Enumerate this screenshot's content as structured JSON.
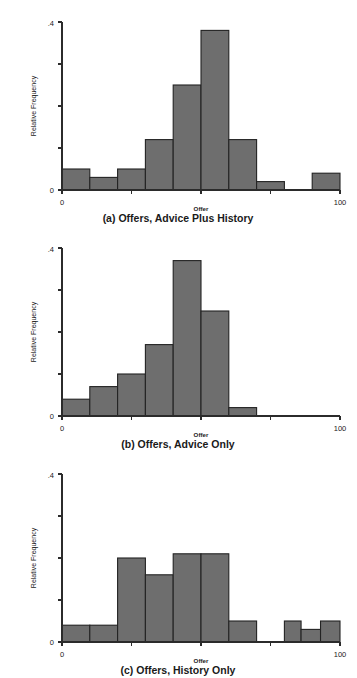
{
  "figure": {
    "title": "",
    "panel_count": 3,
    "bar_color": "#6e6e6e",
    "bar_edge_color": "#232323",
    "background": "#ffffff"
  },
  "panels": [
    {
      "id": "panel-a",
      "caption": "(a) Offers, Advice Plus History",
      "xlabel": "Offer",
      "ylabel": "Relative Frequency",
      "x_tick_labels": [
        "0",
        "",
        "",
        "",
        "100"
      ],
      "y_tick_labels": [
        "0",
        "",
        "",
        "",
        ".4"
      ]
    },
    {
      "id": "panel-b",
      "caption": "(b) Offers, Advice Only",
      "xlabel": "Offer",
      "ylabel": "Relative Frequency",
      "x_tick_labels": [
        "0",
        "",
        "",
        "",
        "100"
      ],
      "y_tick_labels": [
        "0",
        "",
        "",
        "",
        ".4"
      ]
    },
    {
      "id": "panel-c",
      "caption": "(c) Offers, History Only",
      "xlabel": "Offer",
      "ylabel": "Relative Frequency",
      "x_tick_labels": [
        "0",
        "",
        "",
        "",
        "100"
      ],
      "y_tick_labels": [
        "0",
        "",
        "",
        "",
        ".4"
      ]
    }
  ],
  "chart_data": [
    {
      "type": "bar",
      "title": "(a) Offers, Advice Plus History",
      "xlabel": "Offer",
      "ylabel": "Relative Frequency",
      "xlim": [
        0,
        100
      ],
      "ylim": [
        0,
        0.4
      ],
      "x_ticks": [
        0,
        25,
        50,
        75,
        100
      ],
      "x_tick_labels": [
        "0",
        "",
        "",
        "",
        "100"
      ],
      "y_ticks": [
        0,
        0.1,
        0.2,
        0.3,
        0.4
      ],
      "y_tick_labels": [
        "0",
        "",
        "",
        "",
        ".4"
      ],
      "grid": false,
      "legend": false,
      "bin_edges": [
        0,
        10,
        20,
        30,
        40,
        50,
        60,
        70,
        80,
        90,
        100
      ],
      "bins": [
        {
          "x0": 0,
          "x1": 10,
          "value": 0.05
        },
        {
          "x0": 10,
          "x1": 20,
          "value": 0.03
        },
        {
          "x0": 20,
          "x1": 30,
          "value": 0.05
        },
        {
          "x0": 30,
          "x1": 40,
          "value": 0.12
        },
        {
          "x0": 40,
          "x1": 50,
          "value": 0.25
        },
        {
          "x0": 50,
          "x1": 60,
          "value": 0.38
        },
        {
          "x0": 60,
          "x1": 70,
          "value": 0.12
        },
        {
          "x0": 70,
          "x1": 80,
          "value": 0.02
        },
        {
          "x0": 80,
          "x1": 90,
          "value": 0.0
        },
        {
          "x0": 90,
          "x1": 100,
          "value": 0.04
        }
      ],
      "categories": [
        "0-10",
        "10-20",
        "20-30",
        "30-40",
        "40-50",
        "50-60",
        "60-70",
        "70-80",
        "80-90",
        "90-100"
      ],
      "values": [
        0.05,
        0.03,
        0.05,
        0.12,
        0.25,
        0.38,
        0.12,
        0.02,
        0.0,
        0.04
      ]
    },
    {
      "type": "bar",
      "title": "(b) Offers, Advice Only",
      "xlabel": "Offer",
      "ylabel": "Relative Frequency",
      "xlim": [
        0,
        100
      ],
      "ylim": [
        0,
        0.4
      ],
      "x_ticks": [
        0,
        25,
        50,
        75,
        100
      ],
      "x_tick_labels": [
        "0",
        "",
        "",
        "",
        "100"
      ],
      "y_ticks": [
        0,
        0.1,
        0.2,
        0.3,
        0.4
      ],
      "y_tick_labels": [
        "0",
        "",
        "",
        "",
        ".4"
      ],
      "grid": false,
      "legend": false,
      "bin_edges": [
        0,
        10,
        20,
        30,
        40,
        50,
        60,
        70
      ],
      "bins": [
        {
          "x0": 0,
          "x1": 10,
          "value": 0.04
        },
        {
          "x0": 10,
          "x1": 20,
          "value": 0.07
        },
        {
          "x0": 20,
          "x1": 30,
          "value": 0.1
        },
        {
          "x0": 30,
          "x1": 40,
          "value": 0.17
        },
        {
          "x0": 40,
          "x1": 50,
          "value": 0.37
        },
        {
          "x0": 50,
          "x1": 60,
          "value": 0.25
        },
        {
          "x0": 60,
          "x1": 70,
          "value": 0.02
        }
      ],
      "categories": [
        "0-10",
        "10-20",
        "20-30",
        "30-40",
        "40-50",
        "50-60",
        "60-70"
      ],
      "values": [
        0.04,
        0.07,
        0.1,
        0.17,
        0.37,
        0.25,
        0.02
      ]
    },
    {
      "type": "bar",
      "title": "(c) Offers, History Only",
      "xlabel": "Offer",
      "ylabel": "Relative Frequency",
      "xlim": [
        0,
        100
      ],
      "ylim": [
        0,
        0.4
      ],
      "x_ticks": [
        0,
        25,
        50,
        75,
        100
      ],
      "x_tick_labels": [
        "0",
        "",
        "",
        "",
        "100"
      ],
      "y_ticks": [
        0,
        0.1,
        0.2,
        0.3,
        0.4
      ],
      "y_tick_labels": [
        "0",
        "",
        "",
        "",
        ".4"
      ],
      "grid": false,
      "legend": false,
      "bin_edges": [
        0,
        10,
        20,
        30,
        40,
        50,
        60,
        70,
        80,
        85,
        92,
        100
      ],
      "bins": [
        {
          "x0": 0,
          "x1": 10,
          "value": 0.04
        },
        {
          "x0": 10,
          "x1": 20,
          "value": 0.04
        },
        {
          "x0": 20,
          "x1": 30,
          "value": 0.2
        },
        {
          "x0": 30,
          "x1": 40,
          "value": 0.16
        },
        {
          "x0": 40,
          "x1": 50,
          "value": 0.21
        },
        {
          "x0": 50,
          "x1": 60,
          "value": 0.21
        },
        {
          "x0": 60,
          "x1": 70,
          "value": 0.05
        },
        {
          "x0": 70,
          "x1": 80,
          "value": 0.0
        },
        {
          "x0": 80,
          "x1": 86,
          "value": 0.05
        },
        {
          "x0": 86,
          "x1": 93,
          "value": 0.03
        },
        {
          "x0": 93,
          "x1": 100,
          "value": 0.05
        }
      ],
      "categories": [
        "0-10",
        "10-20",
        "20-30",
        "30-40",
        "40-50",
        "50-60",
        "60-70",
        "70-80",
        "80-86",
        "86-93",
        "93-100"
      ],
      "values": [
        0.04,
        0.04,
        0.2,
        0.16,
        0.21,
        0.21,
        0.05,
        0.0,
        0.05,
        0.03,
        0.05
      ]
    }
  ]
}
